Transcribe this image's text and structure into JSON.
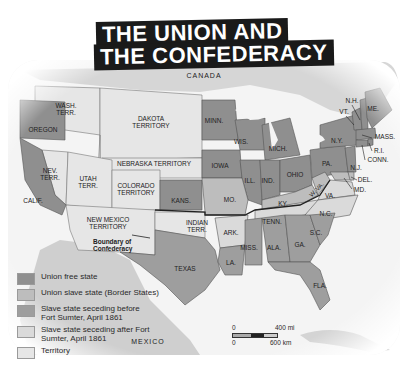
{
  "title": {
    "line1": "THE UNION AND",
    "line2": "THE CONFEDERACY"
  },
  "colors": {
    "union_free": "#8f8f8f",
    "union_slave": "#bdbdbd",
    "seceded_before": "#9e9e9e",
    "seceded_after": "#dadada",
    "territory": "#e6e6e6",
    "foreign": "#d2d2d2",
    "water": "#f4f4f4",
    "title_bg": "#1a1a1a"
  },
  "places": {
    "canada": "CANADA",
    "mexico": "MEXICO"
  },
  "states": {
    "wash": [
      "WASH.",
      "TERR."
    ],
    "oregon": "OREGON",
    "dakota": [
      "DAKOTA",
      "TERRITORY"
    ],
    "minn": "MINN.",
    "wis": "WIS.",
    "mich": "MICH.",
    "ny": "N.Y.",
    "vt": "VT.",
    "nh": "N.H.",
    "me": "ME.",
    "mass": "MASS.",
    "ri": "R.I.",
    "conn": "CONN.",
    "nev": [
      "NEV.",
      "TERR."
    ],
    "utah": [
      "UTAH",
      "TERR."
    ],
    "nebraska": "NEBRASKA TERRITORY",
    "colorado": [
      "COLORADO",
      "TERRITORY"
    ],
    "iowa": "IOWA",
    "ill": "ILL.",
    "ind": "IND.",
    "ohio": "OHIO",
    "pa": "PA.",
    "nj": "N.J.",
    "del": "DEL.",
    "md": "MD.",
    "wva": "W. VA.",
    "va": "VA.",
    "calif": "CALIF.",
    "kans": "KANS.",
    "mo": "MO.",
    "ky": "KY.",
    "new_mexico": [
      "NEW MEXICO",
      "TERRITORY"
    ],
    "indian": [
      "INDIAN",
      "TERR."
    ],
    "tenn": "TENN.",
    "nc": "N.C.",
    "ark": "ARK.",
    "sc": "S.C.",
    "miss": "MISS.",
    "ala": "ALA.",
    "ga": "GA.",
    "la": "LA.",
    "texas": "TEXAS",
    "fla": "FLA."
  },
  "annotation": {
    "boundary": [
      "Boundary of",
      "Confederacy"
    ]
  },
  "legend": [
    {
      "label": "Union free state",
      "color": "#8f8f8f"
    },
    {
      "label": "Union slave state (Border States)",
      "color": "#bdbdbd"
    },
    {
      "label": "Slave state seceding before Fort Sumter, April 1861",
      "color": "#9e9e9e"
    },
    {
      "label": "Slave state seceding after Fort Sumter, April 1861",
      "color": "#dadada"
    },
    {
      "label": "Territory",
      "color": "#e6e6e6"
    }
  ],
  "scale": {
    "top_zero": "0",
    "top_value": "400 mi",
    "bottom_zero": "0",
    "bottom_value": "600 km"
  }
}
